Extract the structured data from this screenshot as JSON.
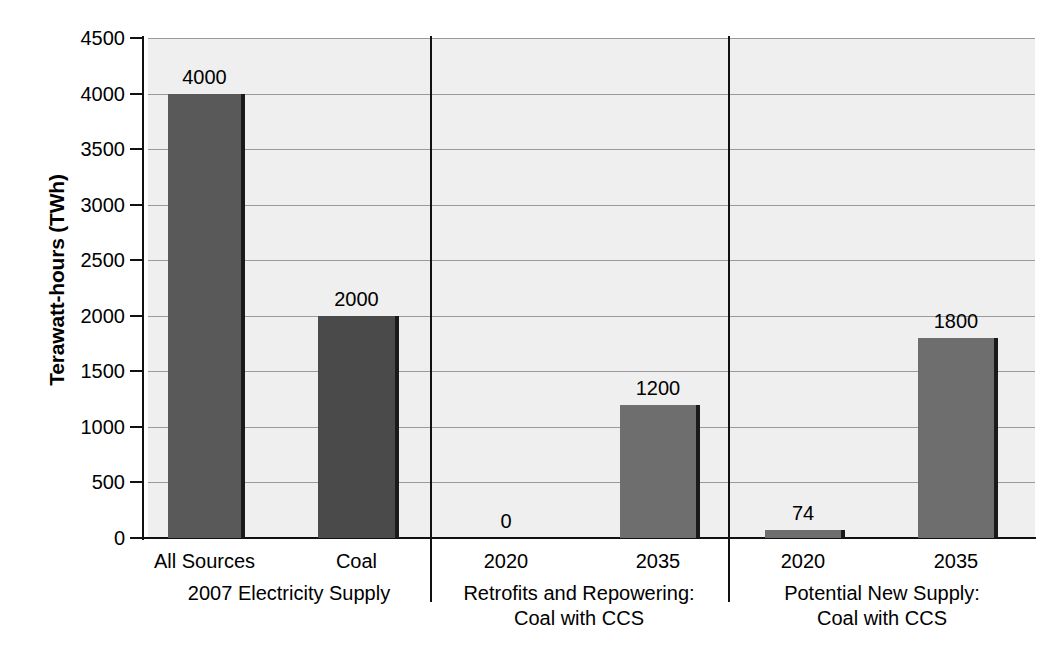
{
  "chart_data": {
    "type": "bar",
    "title": "",
    "xlabel": "",
    "ylabel": "Terawatt-hours (TWh)",
    "ylim": [
      0,
      4500
    ],
    "ytick_step": 500,
    "grid": true,
    "legend": false,
    "categories": [
      "All Sources",
      "Coal",
      "2020",
      "2035",
      "2020",
      "2035"
    ],
    "values": [
      4000,
      2000,
      0,
      1200,
      74,
      1800
    ],
    "value_labels": [
      "4000",
      "2000",
      "0",
      "1200",
      "74",
      "1800"
    ],
    "ytick_labels": [
      "0",
      "500",
      "1000",
      "1500",
      "2000",
      "2500",
      "3000",
      "3500",
      "4000",
      "4500"
    ],
    "groups": [
      {
        "label_line1": "2007 Electricity Supply",
        "label_line2": "",
        "categories": [
          "All Sources",
          "Coal"
        ]
      },
      {
        "label_line1": "Retrofits and Repowering:",
        "label_line2": "Coal with CCS",
        "categories": [
          "2020",
          "2035"
        ]
      },
      {
        "label_line1": "Potential New Supply:",
        "label_line2": "Coal with CCS",
        "categories": [
          "2020",
          "2035"
        ]
      }
    ],
    "bar_colors": [
      "#595959",
      "#4a4a4a",
      "#6e6e6e",
      "#6e6e6e",
      "#6e6e6e",
      "#6e6e6e"
    ],
    "plot_background": "#efefef",
    "gridline_color": "#9a9a9a",
    "axis_color": "#111111"
  },
  "axis": {
    "y_title": "Terawatt-hours (TWh)"
  }
}
